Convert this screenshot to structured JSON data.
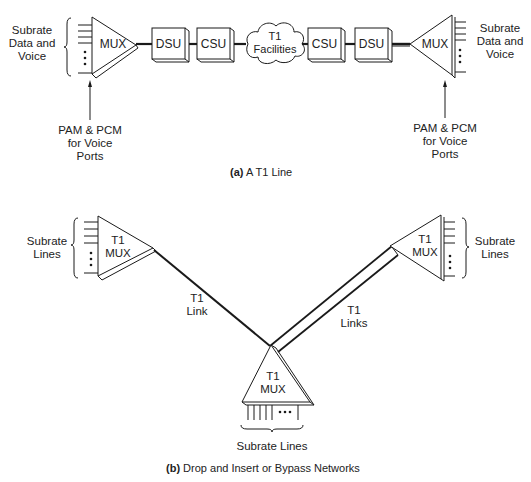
{
  "part_a": {
    "caption_prefix": "(a)",
    "caption_text": "A T1 Line",
    "left": {
      "subrate_label_line1": "Subrate",
      "subrate_label_line2": "Data and",
      "subrate_label_line3": "Voice",
      "mux_label": "MUX",
      "voice_label_line1": "PAM & PCM",
      "voice_label_line2": "for Voice",
      "voice_label_line3": "Ports"
    },
    "chain": [
      {
        "type": "box",
        "label": "DSU"
      },
      {
        "type": "box",
        "label": "CSU"
      },
      {
        "type": "cloud",
        "label_line1": "T1",
        "label_line2": "Facilities"
      },
      {
        "type": "box",
        "label": "CSU"
      },
      {
        "type": "box",
        "label": "DSU"
      }
    ],
    "right": {
      "subrate_label_line1": "Subrate",
      "subrate_label_line2": "Data and",
      "subrate_label_line3": "Voice",
      "mux_label": "MUX",
      "voice_label_line1": "PAM & PCM",
      "voice_label_line2": "for Voice",
      "voice_label_line3": "Ports"
    }
  },
  "part_b": {
    "caption_prefix": "(b)",
    "caption_text": "Drop and Insert or Bypass Networks",
    "left_mux": {
      "line1": "T1",
      "line2": "MUX",
      "subrate_line1": "Subrate",
      "subrate_line2": "Lines"
    },
    "right_mux": {
      "line1": "T1",
      "line2": "MUX",
      "subrate_line1": "Subrate",
      "subrate_line2": "Lines"
    },
    "bottom_mux": {
      "line1": "T1",
      "line2": "MUX",
      "subrate_label": "Subrate Lines"
    },
    "link_left": {
      "line1": "T1",
      "line2": "Link"
    },
    "link_right": {
      "line1": "T1",
      "line2": "Links"
    }
  }
}
